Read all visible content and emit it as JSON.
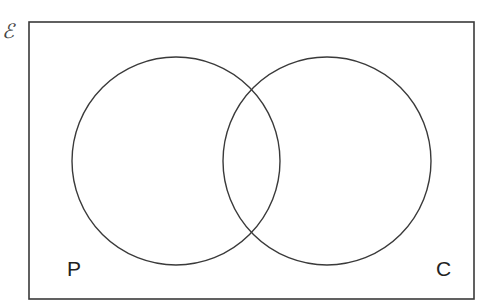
{
  "diagram": {
    "type": "venn",
    "universal_set_label": "ℰ",
    "sets": [
      {
        "label": "P",
        "cx": 176,
        "cy": 161,
        "r": 104
      },
      {
        "label": "C",
        "cx": 327,
        "cy": 161,
        "r": 104
      }
    ],
    "frame": {
      "x": 29,
      "y": 22,
      "width": 445,
      "height": 277
    },
    "stroke_color": "#3a3a3a",
    "background": "#ffffff"
  }
}
